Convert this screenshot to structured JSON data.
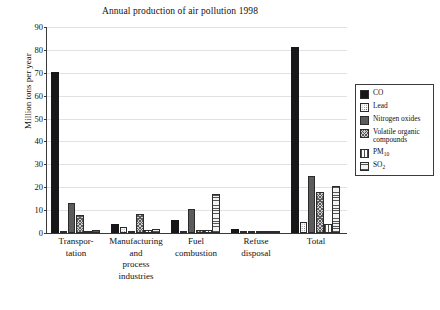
{
  "chart_data": {
    "type": "bar",
    "title": "Annual production of air pollution 1998",
    "xlabel": "",
    "ylabel": "Million tons per year",
    "ylim": [
      0,
      90
    ],
    "ytick_step": 10,
    "yticks": [
      0,
      10,
      20,
      30,
      40,
      50,
      60,
      70,
      80,
      90
    ],
    "grid": true,
    "legend_position": "right",
    "categories": [
      "Transpor-\ntation",
      "Manufacturing\nand\nprocess\nindustries",
      "Fuel\ncombustion",
      "Refuse\ndisposal",
      "Total"
    ],
    "series": [
      {
        "name": "CO",
        "pattern": "solid",
        "values": [
          70.5,
          4.1,
          5.8,
          1.6,
          81.3
        ]
      },
      {
        "name": "Lead",
        "pattern": "dots",
        "values": [
          0.6,
          2.7,
          0.9,
          1.0,
          4.9
        ]
      },
      {
        "name": "Nitrogen oxides",
        "pattern": "stipple",
        "values": [
          13.0,
          0.9,
          10.7,
          0.3,
          25.1
        ]
      },
      {
        "name": "Volatile organic compounds",
        "pattern": "cross",
        "values": [
          7.9,
          8.3,
          1.3,
          0.4,
          18.0
        ]
      },
      {
        "name": "PM10",
        "pattern": "vert",
        "values": [
          0.7,
          1.2,
          1.5,
          0.9,
          3.9
        ]
      },
      {
        "name": "SO2",
        "pattern": "horz",
        "values": [
          1.5,
          1.9,
          17.2,
          0.9,
          20.7
        ]
      }
    ]
  },
  "legend": {
    "entries": [
      {
        "label": "CO",
        "label_sub": "",
        "label_tail": ""
      },
      {
        "label": "Lead",
        "label_sub": "",
        "label_tail": ""
      },
      {
        "label": "Nitrogen oxides",
        "label_sub": "",
        "label_tail": ""
      },
      {
        "label": "Volatile organic compounds",
        "label_sub": "",
        "label_tail": ""
      },
      {
        "label": "PM",
        "label_sub": "10",
        "label_tail": ""
      },
      {
        "label": "SO",
        "label_sub": "2",
        "label_tail": ""
      }
    ]
  },
  "axis": {
    "y_labels": [
      "90",
      "80",
      "70",
      "60",
      "50",
      "40",
      "30",
      "20",
      "10",
      "0"
    ]
  }
}
